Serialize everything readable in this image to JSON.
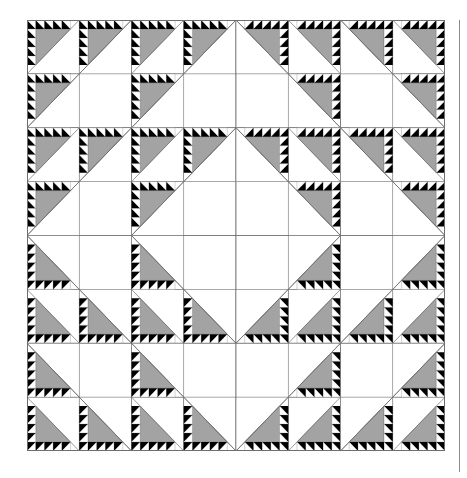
{
  "figure": {
    "grid": {
      "rows": 4,
      "cols": 4
    },
    "units_per_block_side": 2,
    "sawtooth_per_unit_side": 5,
    "colors": {
      "background": "#ffffff",
      "gray": "#a3a3a3",
      "black": "#000000",
      "line": "#6e6e6e",
      "rule": "#8a8a8a"
    },
    "symmetry": "four-fold mirror (left/right halves and top/bottom halves mirrored)",
    "quadrants": [
      {
        "name": "top-left",
        "rows": [
          0,
          1
        ],
        "cols": [
          0,
          1
        ],
        "flip_x": false,
        "flip_y": false
      },
      {
        "name": "top-right",
        "rows": [
          0,
          1
        ],
        "cols": [
          2,
          3
        ],
        "flip_x": true,
        "flip_y": false
      },
      {
        "name": "bottom-left",
        "rows": [
          2,
          3
        ],
        "cols": [
          0,
          1
        ],
        "flip_x": false,
        "flip_y": true
      },
      {
        "name": "bottom-right",
        "rows": [
          2,
          3
        ],
        "cols": [
          2,
          3
        ],
        "flip_x": true,
        "flip_y": true
      }
    ]
  }
}
